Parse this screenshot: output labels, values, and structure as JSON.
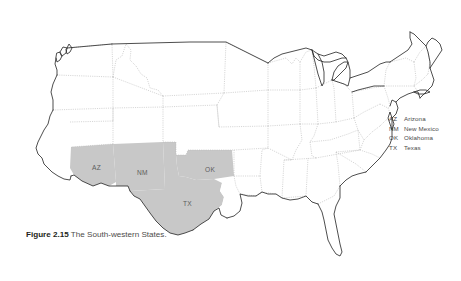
{
  "figure": {
    "caption_number": "Figure 2.15",
    "caption_text": "The South-western States."
  },
  "map": {
    "title": "united-states-map",
    "shaded_fill": "#c8c8c8",
    "border_color": "#b4b4b4",
    "outline_color": "#3a3a3a",
    "background": "#ffffff",
    "shaded_states": [
      {
        "abbr": "AZ",
        "name": "Arizona",
        "x": 92,
        "y": 164
      },
      {
        "abbr": "NM",
        "name": "New Mexico",
        "x": 137,
        "y": 169
      },
      {
        "abbr": "OK",
        "name": "Oklahoma",
        "x": 205,
        "y": 166
      },
      {
        "abbr": "TX",
        "name": "Texas",
        "x": 183,
        "y": 200
      }
    ]
  },
  "legend": {
    "entries": [
      {
        "abbr": "AZ",
        "name": "Arizona"
      },
      {
        "abbr": "NM",
        "name": "New Mexico"
      },
      {
        "abbr": "OK",
        "name": "Oklahoma"
      },
      {
        "abbr": "TX",
        "name": "Texas"
      }
    ]
  }
}
